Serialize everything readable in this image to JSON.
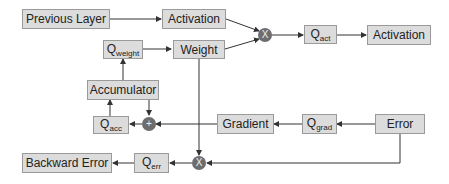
{
  "diagram": {
    "nodes": {
      "previous_layer": "Previous Layer",
      "activation_in": "Activation",
      "weight": "Weight",
      "q_weight_base": "Q",
      "q_weight_sub": "weight",
      "accumulator": "Accumulator",
      "q_acc_base": "Q",
      "q_acc_sub": "acc",
      "q_act_base": "Q",
      "q_act_sub": "act",
      "activation_out": "Activation",
      "gradient": "Gradient",
      "q_grad_base": "Q",
      "q_grad_sub": "grad",
      "error": "Error",
      "q_err_base": "Q",
      "q_err_sub": "err",
      "backward_error": "Backward Error"
    },
    "operators": {
      "mult_forward": "X",
      "add_update": "+",
      "mult_backward": "X"
    },
    "colors": {
      "box_fill": "#dcdcdc",
      "box_border": "#9a9a9a",
      "operator_fill": "#6d6d6d",
      "line": "#333333"
    }
  }
}
